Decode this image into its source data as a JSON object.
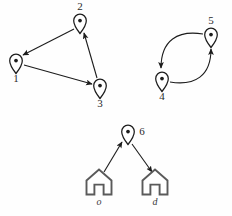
{
  "diagram": {
    "background_color": "#fefefe",
    "stroke_color": "#1c1c1c",
    "house_stroke_color": "#5a5a5a",
    "label_color": "#2b2b2b",
    "nodes": [
      {
        "id": "1",
        "label": "1",
        "icon": "map-pin-icon",
        "x": 16,
        "y": 62,
        "label_x": 16,
        "label_y": 79,
        "label_pos": "below"
      },
      {
        "id": "2",
        "label": "2",
        "icon": "map-pin-icon",
        "x": 80,
        "y": 22,
        "label_x": 80,
        "label_y": 7,
        "label_pos": "above"
      },
      {
        "id": "3",
        "label": "3",
        "icon": "map-pin-icon",
        "x": 100,
        "y": 87,
        "label_x": 100,
        "label_y": 104,
        "label_pos": "below"
      },
      {
        "id": "4",
        "label": "4",
        "icon": "map-pin-icon",
        "x": 162,
        "y": 80,
        "label_x": 162,
        "label_y": 97,
        "label_pos": "below"
      },
      {
        "id": "5",
        "label": "5",
        "icon": "map-pin-icon",
        "x": 211,
        "y": 36,
        "label_x": 211,
        "label_y": 21,
        "label_pos": "above"
      },
      {
        "id": "6",
        "label": "6",
        "icon": "map-pin-icon",
        "x": 128,
        "y": 133,
        "label_x": 142,
        "label_y": 132,
        "label_pos": "right"
      }
    ],
    "endpoints": [
      {
        "id": "o",
        "label": "o",
        "icon": "house-icon",
        "x": 99,
        "y": 182,
        "label_x": 99,
        "label_y": 203
      },
      {
        "id": "d",
        "label": "d",
        "icon": "house-icon",
        "x": 155,
        "y": 182,
        "label_x": 155,
        "label_y": 203
      }
    ],
    "edges": [
      {
        "id": "e-2-1",
        "from": "2",
        "to": "1",
        "type": "straight",
        "x1": 74,
        "y1": 29,
        "x2": 23,
        "y2": 55
      },
      {
        "id": "e-1-3",
        "from": "1",
        "to": "3",
        "type": "straight",
        "x1": 24,
        "y1": 65,
        "x2": 92,
        "y2": 84
      },
      {
        "id": "e-3-2",
        "from": "3",
        "to": "2",
        "type": "straight",
        "x1": 97,
        "y1": 78,
        "x2": 84,
        "y2": 33
      },
      {
        "id": "e-5-4",
        "from": "5",
        "to": "4",
        "type": "curve",
        "x1": 203,
        "y1": 34,
        "cx": 166,
        "cy": 36,
        "x2": 161,
        "y2": 68
      },
      {
        "id": "e-4-5",
        "from": "4",
        "to": "5",
        "type": "curve",
        "x1": 170,
        "y1": 82,
        "cx": 206,
        "cy": 80,
        "x2": 211,
        "y2": 49
      },
      {
        "id": "e-o-6",
        "from": "o",
        "to": "6",
        "type": "straight",
        "x1": 104,
        "y1": 172,
        "x2": 122,
        "y2": 142
      },
      {
        "id": "e-6-d",
        "from": "6",
        "to": "d",
        "type": "straight",
        "x1": 132,
        "y1": 144,
        "x2": 152,
        "y2": 172
      }
    ],
    "legend": {
      "node_icon_name": "map-pin-icon",
      "endpoint_icon_name": "house-icon",
      "arrow_icon_name": "arrowhead-icon"
    }
  }
}
